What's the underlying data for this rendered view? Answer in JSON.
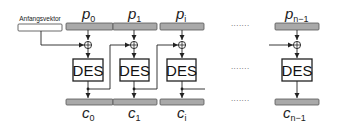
{
  "diagram": {
    "iv_label": "Anfangsvektor",
    "cipher_label": "DES",
    "ellipsis": "·······",
    "colors": {
      "block_fill": "#a9a9a9",
      "block_stroke": "#555555",
      "line": "#222222",
      "box_stroke": "#222222"
    },
    "stages": [
      {
        "plain": "p",
        "plain_sub": "0",
        "cipher": "c",
        "cipher_sub": "0"
      },
      {
        "plain": "p",
        "plain_sub": "1",
        "cipher": "c",
        "cipher_sub": "1"
      },
      {
        "plain": "p",
        "plain_sub": "i",
        "cipher": "c",
        "cipher_sub": "i"
      },
      {
        "plain": "p",
        "plain_sub": "n−1",
        "cipher": "c",
        "cipher_sub": "n−1"
      }
    ]
  }
}
